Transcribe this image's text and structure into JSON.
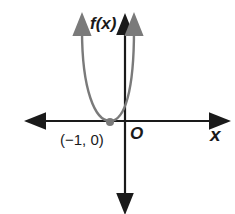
{
  "diagram": {
    "y_axis_label": "f(x)",
    "x_axis_label": "x",
    "origin_label": "O",
    "vertex_label": "(−1, 0)",
    "curve": "parabola opening upward with vertex at (-1, 0)",
    "colors": {
      "axes": "#1a1a1a",
      "curve": "#7a7a7a",
      "point": "#7a7a7a"
    }
  }
}
